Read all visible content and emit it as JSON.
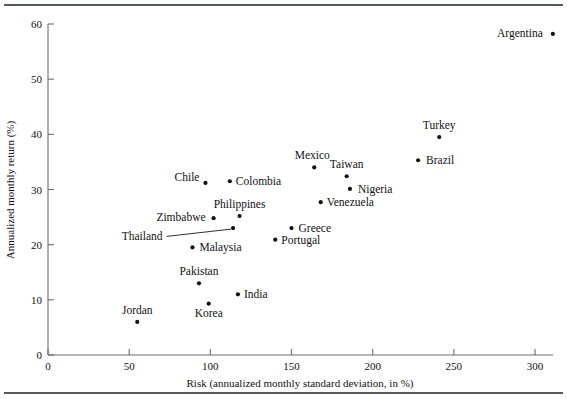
{
  "chart_data": {
    "type": "scatter",
    "title": "",
    "xlabel": "Risk (annualized monthly standard deviation, in %)",
    "ylabel": "Annualized monthly return (%)",
    "xlim": [
      0,
      310
    ],
    "ylim": [
      0,
      60
    ],
    "xticks": [
      0,
      50,
      100,
      150,
      200,
      250,
      300
    ],
    "yticks": [
      0,
      10,
      20,
      30,
      40,
      50,
      60
    ],
    "grid": false,
    "legend": "none",
    "points": [
      {
        "label": "Argentina",
        "x": 311,
        "y": 58.2,
        "label_side": "left",
        "dx": -10,
        "dy": 3
      },
      {
        "label": "Turkey",
        "x": 241,
        "y": 39.5,
        "label_side": "above",
        "dx": 0,
        "dy": -8
      },
      {
        "label": "Brazil",
        "x": 228,
        "y": 35.3,
        "label_side": "right",
        "dx": 8,
        "dy": 4
      },
      {
        "label": "Taiwan",
        "x": 184,
        "y": 32.4,
        "label_side": "above",
        "dx": 0,
        "dy": -8
      },
      {
        "label": "Mexico",
        "x": 164,
        "y": 34.0,
        "label_side": "above",
        "dx": -2,
        "dy": -8
      },
      {
        "label": "Nigeria",
        "x": 186,
        "y": 30.1,
        "label_side": "right",
        "dx": 8,
        "dy": 4
      },
      {
        "label": "Venezuela",
        "x": 168,
        "y": 27.7,
        "label_side": "right",
        "dx": 6,
        "dy": 4
      },
      {
        "label": "Colombia",
        "x": 112,
        "y": 31.5,
        "label_side": "right",
        "dx": 6,
        "dy": 4
      },
      {
        "label": "Chile",
        "x": 97,
        "y": 31.2,
        "label_side": "left",
        "dx": -6,
        "dy": -2
      },
      {
        "label": "Philippines",
        "x": 118,
        "y": 25.2,
        "label_side": "above",
        "dx": 0,
        "dy": -8
      },
      {
        "label": "Zimbabwe",
        "x": 102,
        "y": 24.8,
        "label_side": "left",
        "dx": -8,
        "dy": 3
      },
      {
        "label": "Greece",
        "x": 150,
        "y": 23.0,
        "label_side": "right",
        "dx": 7,
        "dy": 4
      },
      {
        "label": "Portugal",
        "x": 140,
        "y": 20.9,
        "label_side": "right",
        "dx": 6,
        "dy": 4
      },
      {
        "label": "Thailand",
        "x": 114,
        "y": 23.0,
        "label_side": "leader",
        "dx": 0,
        "dy": 0
      },
      {
        "label": "Malaysia",
        "x": 89,
        "y": 19.5,
        "label_side": "right",
        "dx": 7,
        "dy": 4
      },
      {
        "label": "Pakistan",
        "x": 93,
        "y": 13.0,
        "label_side": "above",
        "dx": 0,
        "dy": -8
      },
      {
        "label": "India",
        "x": 117,
        "y": 11.0,
        "label_side": "right",
        "dx": 6,
        "dy": 4
      },
      {
        "label": "Korea",
        "x": 99,
        "y": 9.3,
        "label_side": "below",
        "dx": 0,
        "dy": 13
      },
      {
        "label": "Jordan",
        "x": 55,
        "y": 6.0,
        "label_side": "above",
        "dx": 0,
        "dy": -8
      }
    ],
    "leader_lines": [
      {
        "label": "Thailand",
        "label_x": 41,
        "label_y": 21.5,
        "point_x": 114,
        "point_y": 23.0
      }
    ]
  }
}
